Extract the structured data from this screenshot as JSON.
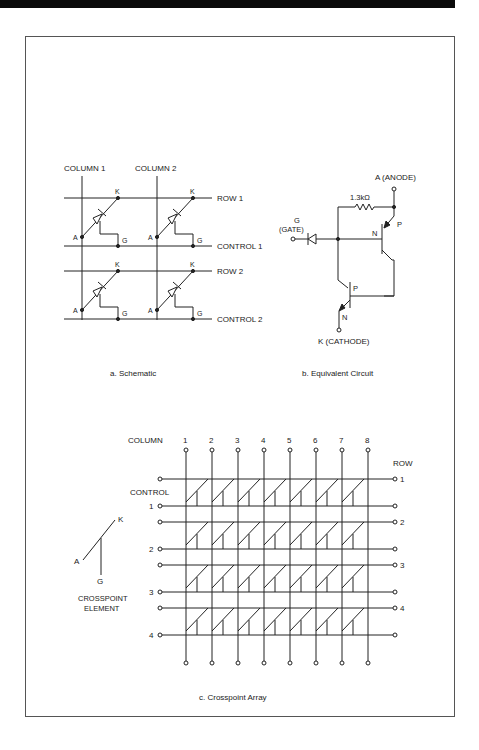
{
  "figure": {
    "schematic": {
      "caption": "a. Schematic",
      "columns": [
        "COLUMN 1",
        "COLUMN 2"
      ],
      "rows": [
        "ROW 1",
        "ROW 2"
      ],
      "controls": [
        "CONTROL 1",
        "CONTROL 2"
      ],
      "terminals": {
        "anode": "A",
        "cathode": "K",
        "gate": "G"
      }
    },
    "equivalent": {
      "caption": "b. Equivalent Circuit",
      "anode": "A (ANODE)",
      "cathode": "K (CATHODE)",
      "gate": "G",
      "gate_sub": "(GATE)",
      "resistor": "1.3kΩ",
      "p": "P",
      "n": "N"
    },
    "array": {
      "caption": "c. Crosspoint Array",
      "column_label": "COLUMN",
      "column_numbers": [
        "1",
        "2",
        "3",
        "4",
        "5",
        "6",
        "7",
        "8"
      ],
      "row_label": "ROW",
      "row_numbers": [
        "1",
        "2",
        "3",
        "4"
      ],
      "control_label": "CONTROL",
      "control_numbers": [
        "1",
        "2",
        "3",
        "4"
      ]
    },
    "element": {
      "label_line1": "CROSSPOINT",
      "label_line2": "ELEMENT",
      "a": "A",
      "k": "K",
      "g": "G"
    }
  }
}
